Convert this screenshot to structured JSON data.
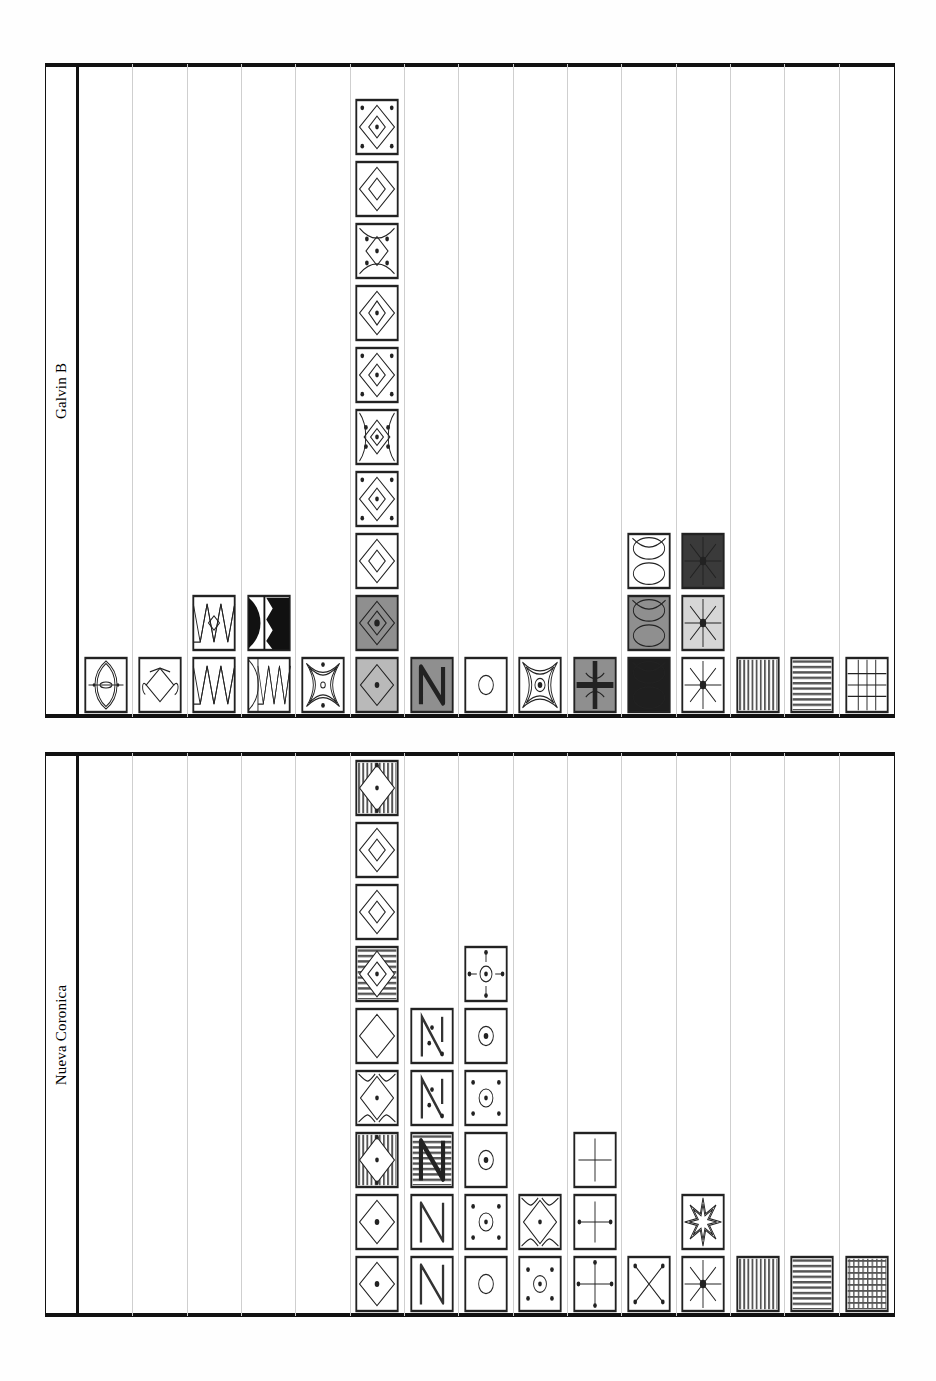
{
  "page": {
    "width": 936,
    "height": 1381,
    "background": "#fefefe",
    "ink": "#111111",
    "gridline": "#cfcfcf"
  },
  "chart_data": {
    "type": "bar",
    "xlabel": "",
    "ylabel": "Count of occurrences",
    "grid": true,
    "legend_position": "none",
    "categories": [
      "concentric-lens",
      "lozenge-chain",
      "zigzag-band",
      "zigzag-half-disc",
      "concave-square-dot",
      "nested-diamond",
      "N-glyph",
      "circle",
      "concave-square-ring",
      "cross-quatrefoil",
      "double-lens",
      "eight-point-star",
      "vertical-stripes",
      "horizontal-stripes",
      "lattice-grid"
    ],
    "series": [
      {
        "name": "Galvin B",
        "values": [
          1,
          1,
          2,
          2,
          1,
          10,
          1,
          1,
          1,
          1,
          3,
          3,
          1,
          1,
          1
        ],
        "ylim": [
          0,
          11
        ]
      },
      {
        "name": "Nueva Coronica",
        "values": [
          0,
          0,
          0,
          0,
          0,
          9,
          5,
          6,
          2,
          3,
          1,
          2,
          1,
          1,
          1
        ],
        "ylim": [
          0,
          11
        ]
      }
    ]
  },
  "panels": [
    {
      "id": "galvin-b",
      "title": "Galvin B",
      "columns": [
        {
          "index": 0,
          "name": "concentric-lens",
          "count": 1,
          "cells": [
            {
              "motif": "concentric-lens",
              "fill": "#ffffff"
            }
          ]
        },
        {
          "index": 1,
          "name": "lozenge-chain",
          "count": 1,
          "cells": [
            {
              "motif": "lozenge-chain",
              "fill": "#ffffff"
            }
          ]
        },
        {
          "index": 2,
          "name": "zigzag-band",
          "count": 2,
          "cells": [
            {
              "motif": "zigzag-band",
              "fill": "#ffffff"
            },
            {
              "motif": "zigzag-lozenge",
              "fill": "#ffffff"
            }
          ]
        },
        {
          "index": 3,
          "name": "zigzag-half-disc",
          "count": 2,
          "cells": [
            {
              "motif": "zigzag-half-disc",
              "fill": "#ffffff"
            },
            {
              "motif": "half-disc-teeth",
              "fill": "#ffffff"
            }
          ]
        },
        {
          "index": 4,
          "name": "concave-square-dot",
          "count": 1,
          "cells": [
            {
              "motif": "concave-square-dot",
              "fill": "#ffffff"
            }
          ]
        },
        {
          "index": 5,
          "name": "nested-diamond",
          "count": 10,
          "cells": [
            {
              "motif": "diamond-plain",
              "fill": "#b9b9b9"
            },
            {
              "motif": "diamond-nested",
              "fill": "#8f8f8f"
            },
            {
              "motif": "diamond-nested-open",
              "fill": "#ffffff"
            },
            {
              "motif": "diamond-dots",
              "fill": "#ffffff"
            },
            {
              "motif": "diamond-lens-dots",
              "fill": "#ffffff"
            },
            {
              "motif": "diamond-dots",
              "fill": "#ffffff"
            },
            {
              "motif": "diamond-lens",
              "fill": "#ffffff"
            },
            {
              "motif": "concave-diamond-dots",
              "fill": "#ffffff"
            },
            {
              "motif": "diamond-nested-open",
              "fill": "#ffffff"
            },
            {
              "motif": "diamond-dots",
              "fill": "#ffffff"
            }
          ]
        },
        {
          "index": 6,
          "name": "N-glyph",
          "count": 1,
          "cells": [
            {
              "motif": "n-glyph",
              "fill": "#8f8f8f"
            }
          ]
        },
        {
          "index": 7,
          "name": "circle",
          "count": 1,
          "cells": [
            {
              "motif": "circle",
              "fill": "#ffffff"
            }
          ]
        },
        {
          "index": 8,
          "name": "concave-square-ring",
          "count": 1,
          "cells": [
            {
              "motif": "concave-square-ring",
              "fill": "#ffffff"
            }
          ]
        },
        {
          "index": 9,
          "name": "cross-quatrefoil",
          "count": 1,
          "cells": [
            {
              "motif": "cross-quatrefoil",
              "fill": "#8f8f8f"
            }
          ]
        },
        {
          "index": 10,
          "name": "double-lens",
          "count": 3,
          "cells": [
            {
              "motif": "double-lens",
              "fill": "#1f1f1f"
            },
            {
              "motif": "double-lens",
              "fill": "#8f8f8f"
            },
            {
              "motif": "double-lens",
              "fill": "#ffffff"
            }
          ]
        },
        {
          "index": 11,
          "name": "eight-point-star",
          "count": 3,
          "cells": [
            {
              "motif": "eight-point-star",
              "fill": "#ffffff"
            },
            {
              "motif": "eight-point-star",
              "fill": "#d6d6d6"
            },
            {
              "motif": "eight-point-star",
              "fill": "#3a3a3a"
            }
          ]
        },
        {
          "index": 12,
          "name": "vertical-stripes",
          "count": 1,
          "cells": [
            {
              "motif": "vertical-stripes",
              "fill": "#ffffff"
            }
          ]
        },
        {
          "index": 13,
          "name": "horizontal-stripes",
          "count": 1,
          "cells": [
            {
              "motif": "horizontal-stripes",
              "fill": "#ffffff"
            }
          ]
        },
        {
          "index": 14,
          "name": "lattice-grid",
          "count": 1,
          "cells": [
            {
              "motif": "lattice-grid-coarse",
              "fill": "#ffffff"
            }
          ]
        }
      ]
    },
    {
      "id": "nueva-coronica",
      "title": "Nueva Coronica",
      "columns": [
        {
          "index": 0,
          "name": "concentric-lens",
          "count": 0,
          "cells": []
        },
        {
          "index": 1,
          "name": "lozenge-chain",
          "count": 0,
          "cells": []
        },
        {
          "index": 2,
          "name": "zigzag-band",
          "count": 0,
          "cells": []
        },
        {
          "index": 3,
          "name": "zigzag-half-disc",
          "count": 0,
          "cells": []
        },
        {
          "index": 4,
          "name": "concave-square-dot",
          "count": 0,
          "cells": []
        },
        {
          "index": 5,
          "name": "nested-diamond",
          "count": 9,
          "cells": [
            {
              "motif": "diamond-dot",
              "fill": "#ffffff"
            },
            {
              "motif": "diamond-dot",
              "fill": "#ffffff"
            },
            {
              "motif": "diamond-vstripe",
              "fill": "#ffffff"
            },
            {
              "motif": "diamond-corner-arcs",
              "fill": "#ffffff"
            },
            {
              "motif": "diamond-plain-open",
              "fill": "#ffffff"
            },
            {
              "motif": "diamond-hstripe",
              "fill": "#ffffff"
            },
            {
              "motif": "diamond-nested-open",
              "fill": "#ffffff"
            },
            {
              "motif": "diamond-nested-open",
              "fill": "#ffffff"
            },
            {
              "motif": "diamond-vstripe",
              "fill": "#ffffff"
            }
          ]
        },
        {
          "index": 6,
          "name": "N-glyph",
          "count": 5,
          "cells": [
            {
              "motif": "n-glyph-open",
              "fill": "#ffffff"
            },
            {
              "motif": "n-glyph-open",
              "fill": "#ffffff"
            },
            {
              "motif": "n-glyph-hstripe",
              "fill": "#ffffff"
            },
            {
              "motif": "n-glyph-dots",
              "fill": "#ffffff"
            },
            {
              "motif": "n-glyph-dots",
              "fill": "#ffffff"
            }
          ]
        },
        {
          "index": 7,
          "name": "circle",
          "count": 6,
          "cells": [
            {
              "motif": "circle",
              "fill": "#ffffff"
            },
            {
              "motif": "circle-four-dots",
              "fill": "#ffffff"
            },
            {
              "motif": "circle-dot",
              "fill": "#ffffff"
            },
            {
              "motif": "circle-four-dots",
              "fill": "#ffffff"
            },
            {
              "motif": "circle-dot",
              "fill": "#ffffff"
            },
            {
              "motif": "circle-cross-dot",
              "fill": "#ffffff"
            }
          ]
        },
        {
          "index": 8,
          "name": "concave-square-ring",
          "count": 2,
          "cells": [
            {
              "motif": "corner-arcs-dot",
              "fill": "#ffffff"
            },
            {
              "motif": "diamond-corner-arcs",
              "fill": "#ffffff"
            }
          ]
        },
        {
          "index": 9,
          "name": "cross-quatrefoil",
          "count": 3,
          "cells": [
            {
              "motif": "plain-cross",
              "fill": "#ffffff"
            },
            {
              "motif": "cross-dot-ends",
              "fill": "#ffffff"
            },
            {
              "motif": "cross-quad-dots",
              "fill": "#ffffff"
            }
          ]
        },
        {
          "index": 10,
          "name": "double-lens",
          "count": 1,
          "cells": [
            {
              "motif": "x-cross",
              "fill": "#ffffff"
            }
          ]
        },
        {
          "index": 11,
          "name": "eight-point-star",
          "count": 2,
          "cells": [
            {
              "motif": "eight-point-star",
              "fill": "#ffffff"
            },
            {
              "motif": "eight-point-star-outline",
              "fill": "#ffffff"
            }
          ]
        },
        {
          "index": 12,
          "name": "vertical-stripes",
          "count": 1,
          "cells": [
            {
              "motif": "vertical-stripes",
              "fill": "#ffffff"
            }
          ]
        },
        {
          "index": 13,
          "name": "horizontal-stripes",
          "count": 1,
          "cells": [
            {
              "motif": "horizontal-stripes",
              "fill": "#ffffff"
            }
          ]
        },
        {
          "index": 14,
          "name": "lattice-grid",
          "count": 1,
          "cells": [
            {
              "motif": "lattice-grid-fine",
              "fill": "#ffffff"
            }
          ]
        }
      ]
    }
  ]
}
